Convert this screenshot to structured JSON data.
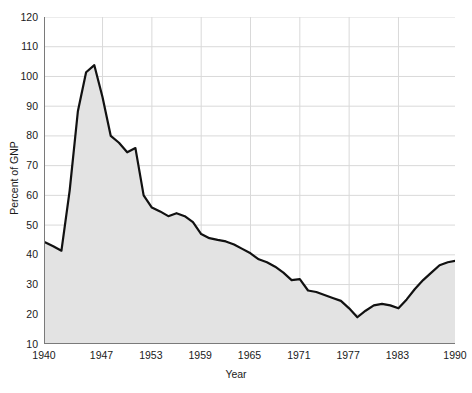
{
  "chart_data": {
    "type": "area",
    "title": "",
    "subtitle": "",
    "xlabel": "Year",
    "ylabel": "Percent of GNP",
    "xlim": [
      1940,
      1990
    ],
    "ylim": [
      10,
      120
    ],
    "xticks": [
      1940,
      1947,
      1953,
      1959,
      1965,
      1971,
      1977,
      1983,
      1990
    ],
    "xticklabels": [
      "1940",
      "1947",
      "1953",
      "1959",
      "1965",
      "1971",
      "1977",
      "1983",
      "1990"
    ],
    "yticks": [
      10,
      20,
      30,
      40,
      50,
      60,
      70,
      80,
      90,
      100,
      110,
      120
    ],
    "yticklabels": [
      "10",
      "20",
      "30",
      "40",
      "50",
      "60",
      "70",
      "80",
      "90",
      "100",
      "110",
      "120"
    ],
    "grid": true,
    "grid_color": "#d9d9d9",
    "legend": "none",
    "line_color": "#111111",
    "fill_color": "#e3e3e3",
    "line_width": 2.2,
    "x": [
      1940,
      1941,
      1942,
      1943,
      1944,
      1945,
      1946,
      1947,
      1948,
      1949,
      1950,
      1951,
      1952,
      1953,
      1954,
      1955,
      1956,
      1957,
      1958,
      1959,
      1960,
      1961,
      1962,
      1963,
      1964,
      1965,
      1966,
      1967,
      1968,
      1969,
      1970,
      1971,
      1972,
      1973,
      1974,
      1975,
      1976,
      1977,
      1978,
      1979,
      1980,
      1981,
      1982,
      1983,
      1984,
      1985,
      1986,
      1987,
      1988,
      1989,
      1990
    ],
    "values": [
      44.2,
      42.9,
      41.4,
      61.6,
      88.3,
      101.4,
      103.8,
      93.0,
      80.0,
      77.7,
      74.5,
      75.9,
      60.0,
      55.9,
      54.6,
      53.0,
      54.0,
      53.0,
      51.0,
      47.0,
      45.6,
      45.0,
      44.5,
      43.5,
      42.0,
      40.5,
      38.5,
      37.5,
      36.0,
      34.0,
      31.5,
      31.8,
      28.0,
      27.5,
      26.5,
      25.5,
      24.5,
      22.0,
      19.0,
      21.2,
      23.0,
      23.5,
      23.0,
      22.0,
      25.0,
      28.5,
      31.5,
      34.0,
      36.5,
      37.5,
      38.0
    ]
  },
  "axes": {
    "x_title": "Year",
    "y_title": "Percent of GNP"
  }
}
